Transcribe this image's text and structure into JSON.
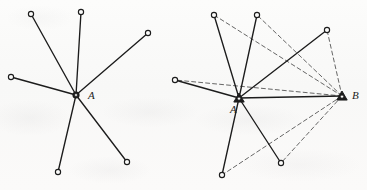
{
  "figure": {
    "kind": "geometry-diagram",
    "title": "",
    "background_color": "#fbfbfa",
    "ink_color": "#1c1c1c",
    "panels": [
      {
        "id": "left-panel",
        "name": "star-graph-center-a",
        "center": {
          "label": "A",
          "x": 76,
          "y": 95,
          "marker": "filled-hub",
          "label_x": 88,
          "label_y": 90
        },
        "outer_nodes": [
          {
            "id": "L1",
            "x": 31,
            "y": 14,
            "marker": "open-circle"
          },
          {
            "id": "L2",
            "x": 81,
            "y": 12,
            "marker": "open-circle"
          },
          {
            "id": "L3",
            "x": 148,
            "y": 33,
            "marker": "open-circle"
          },
          {
            "id": "L4",
            "x": 11,
            "y": 77,
            "marker": "open-circle"
          },
          {
            "id": "L5",
            "x": 58,
            "y": 172,
            "marker": "open-circle"
          },
          {
            "id": "L6",
            "x": 127,
            "y": 162,
            "marker": "open-circle"
          }
        ],
        "solid_edges": [
          [
            "A",
            "L1"
          ],
          [
            "A",
            "L2"
          ],
          [
            "A",
            "L3"
          ],
          [
            "A",
            "L4"
          ],
          [
            "A",
            "L5"
          ],
          [
            "A",
            "L6"
          ]
        ],
        "dashed_edges": []
      },
      {
        "id": "right-panel",
        "name": "star-graph-center-a-plus-b",
        "center": {
          "label": "A",
          "x": 239,
          "y": 98,
          "marker": "triangle-hub",
          "label_x": 230,
          "label_y": 104
        },
        "second_vertex": {
          "label": "B",
          "x": 342,
          "y": 96,
          "marker": "triangle-hub",
          "label_x": 352,
          "label_y": 90
        },
        "outer_nodes": [
          {
            "id": "R1",
            "x": 214,
            "y": 15,
            "marker": "open-circle"
          },
          {
            "id": "R2",
            "x": 257,
            "y": 15,
            "marker": "open-circle"
          },
          {
            "id": "R3",
            "x": 327,
            "y": 30,
            "marker": "open-circle"
          },
          {
            "id": "R4",
            "x": 175,
            "y": 80,
            "marker": "open-circle"
          },
          {
            "id": "R5",
            "x": 222,
            "y": 175,
            "marker": "open-circle"
          },
          {
            "id": "R6",
            "x": 281,
            "y": 163,
            "marker": "open-circle"
          }
        ],
        "solid_edges": [
          [
            "A",
            "R1"
          ],
          [
            "A",
            "R2"
          ],
          [
            "A",
            "R3"
          ],
          [
            "A",
            "R4"
          ],
          [
            "A",
            "R5"
          ],
          [
            "A",
            "R6"
          ],
          [
            "A",
            "B"
          ]
        ],
        "dashed_edges": [
          [
            "B",
            "R1"
          ],
          [
            "B",
            "R2"
          ],
          [
            "B",
            "R3"
          ],
          [
            "B",
            "R4"
          ],
          [
            "B",
            "R5"
          ],
          [
            "B",
            "R6"
          ]
        ]
      }
    ],
    "style": {
      "solid_stroke_width": 1.35,
      "dashed_stroke_width": 0.85,
      "dash_pattern": "4 3",
      "node_radius": 2.6,
      "node_fill": "#fbfbfa"
    }
  }
}
